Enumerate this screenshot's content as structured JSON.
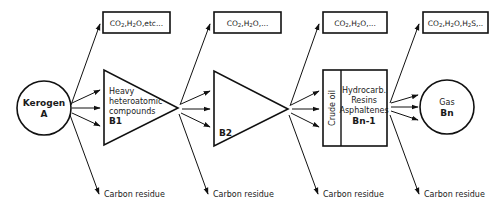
{
  "diagram": {
    "colors": {
      "stroke": "#111111",
      "text": "#1a1a1a",
      "background": "#ffffff"
    },
    "nodes": {
      "kerogen": {
        "title": "Kerogen",
        "code": "A",
        "shape": "circle"
      },
      "b1": {
        "lines": [
          "Heavy",
          "heteroatomic",
          "compounds"
        ],
        "code": "B1",
        "shape": "triangle"
      },
      "b2": {
        "code": "B2",
        "shape": "triangle"
      },
      "bn1": {
        "side_label": "Crude oil",
        "lines": [
          "Hydrocarb.",
          "Resins",
          "Asphaltenes"
        ],
        "code": "Bn-1",
        "shape": "rectangle"
      },
      "gas": {
        "title": "Gas",
        "code": "Bn",
        "shape": "circle"
      }
    },
    "byproducts": [
      {
        "label": "CO2,H2O,etc..."
      },
      {
        "label": "CO2,H2O,..."
      },
      {
        "label": "CO2,H2O,..."
      },
      {
        "label": "CO2,H2O,H2S,..."
      }
    ],
    "residues": [
      {
        "label": "Carbon residue"
      },
      {
        "label": "Carbon residue"
      },
      {
        "label": "Carbon residue"
      },
      {
        "label": "Carbon residue"
      }
    ]
  }
}
